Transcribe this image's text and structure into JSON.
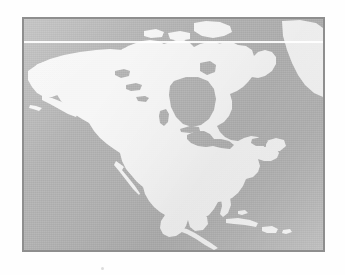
{
  "page": {
    "background_color": "#fefefe",
    "speck_color": "#dcdcdc"
  },
  "figure": {
    "kind": "scanned-grayscale-map",
    "border_color": "#8e8e8e",
    "ocean_color": "#adadad",
    "land_color": "#f5f5f5",
    "scanline_artifact": "white-horizontal-line",
    "projection_hint": "conic-north-america"
  },
  "map": {
    "regions": [
      {
        "id": "alaska",
        "label": "Alaska"
      },
      {
        "id": "canada-mainland",
        "label": "Canada"
      },
      {
        "id": "arctic-archipelago",
        "label": "Canadian Arctic Archipelago"
      },
      {
        "id": "greenland",
        "label": "Greenland"
      },
      {
        "id": "united-states",
        "label": "United States"
      },
      {
        "id": "mexico",
        "label": "Mexico"
      },
      {
        "id": "baja-california",
        "label": "Baja California"
      },
      {
        "id": "central-america",
        "label": "Central America"
      },
      {
        "id": "cuba",
        "label": "Cuba"
      },
      {
        "id": "hispaniola",
        "label": "Hispaniola"
      },
      {
        "id": "newfoundland",
        "label": "Newfoundland"
      }
    ],
    "water_bodies": [
      {
        "id": "pacific-ocean",
        "label": "Pacific Ocean"
      },
      {
        "id": "atlantic-ocean",
        "label": "Atlantic Ocean"
      },
      {
        "id": "arctic-ocean",
        "label": "Arctic Ocean"
      },
      {
        "id": "hudson-bay",
        "label": "Hudson Bay"
      },
      {
        "id": "gulf-of-mexico",
        "label": "Gulf of Mexico"
      },
      {
        "id": "caribbean-sea",
        "label": "Caribbean Sea"
      },
      {
        "id": "great-lakes",
        "label": "Great Lakes"
      },
      {
        "id": "great-slave-lake",
        "label": "Great Slave Lake"
      },
      {
        "id": "great-bear-lake",
        "label": "Great Bear Lake"
      },
      {
        "id": "lake-winnipeg",
        "label": "Lake Winnipeg"
      },
      {
        "id": "baffin-bay",
        "label": "Baffin Bay"
      },
      {
        "id": "gulf-of-california",
        "label": "Gulf of California"
      },
      {
        "id": "gulf-of-st-lawrence",
        "label": "Gulf of St. Lawrence"
      }
    ]
  }
}
